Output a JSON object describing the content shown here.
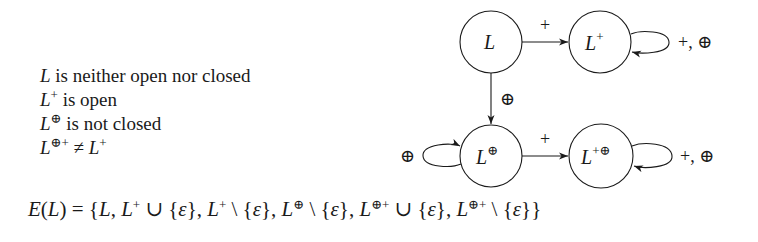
{
  "properties": [
    {
      "base": "L",
      "sup": "",
      "text": " is neither open nor closed"
    },
    {
      "base": "L",
      "sup": "+",
      "text": " is open"
    },
    {
      "base": "L",
      "sup": "⊕",
      "text": " is not closed"
    },
    {
      "base": "L",
      "sup": "⊕+",
      "text": " ≠ ",
      "rhs_base": "L",
      "rhs_sup": "+"
    }
  ],
  "diagram": {
    "nodes": [
      {
        "id": "L",
        "base": "L",
        "sup": ""
      },
      {
        "id": "Lplus",
        "base": "L",
        "sup": "+"
      },
      {
        "id": "Loplus",
        "base": "L",
        "sup": "⊕"
      },
      {
        "id": "Lplusoplus",
        "base": "L",
        "sup": "+⊕"
      }
    ],
    "edges": [
      {
        "from": "L",
        "to": "Lplus",
        "label": "+"
      },
      {
        "from": "L",
        "to": "Loplus",
        "label": "⊕"
      },
      {
        "from": "Loplus",
        "to": "Lplusoplus",
        "label": "+"
      },
      {
        "from": "Lplus",
        "to": "Lplus",
        "label": "+, ⊕"
      },
      {
        "from": "Loplus",
        "to": "Loplus",
        "label": "⊕"
      },
      {
        "from": "Lplusoplus",
        "to": "Lplusoplus",
        "label": "+, ⊕"
      }
    ]
  },
  "equation": {
    "lhs": "E(L)",
    "text": "E(L) = {L, L⁺ ∪ {ε}, L⁺ \\ {ε}, L^⊕ \\ {ε}, L^⊕+ ∪ {ε}, L^⊕+ \\ {ε}}",
    "parts": {
      "p0": "E",
      "p1": "(",
      "p2": "L",
      "p3": ") = {",
      "p4": "L",
      "p5": ", ",
      "p6": "L",
      "p7": "+",
      "p8": " ∪ {",
      "p9": "ε",
      "p10": "}, ",
      "p11": "L",
      "p12": "+",
      "p13": " \\ {",
      "p14": "ε",
      "p15": "}, ",
      "p16": "L",
      "p17": "⊕",
      "p18": " \\ {",
      "p19": "ε",
      "p20": "}, ",
      "p21": "L",
      "p22": "⊕+",
      "p23": " ∪ {",
      "p24": "ε",
      "p25": "}, ",
      "p26": "L",
      "p27": "⊕+",
      "p28": " \\ {",
      "p29": "ε",
      "p30": "}}"
    }
  }
}
